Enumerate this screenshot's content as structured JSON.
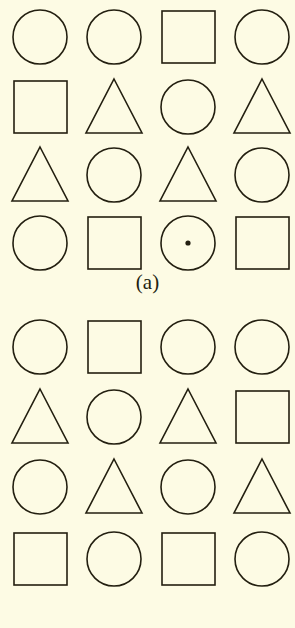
{
  "figure": {
    "background_color": "#fdfbe4",
    "stroke_color": "#231f10",
    "columns": 4,
    "rows": 4,
    "panels": [
      {
        "id": "a",
        "label": "(a)",
        "shapes": [
          [
            {
              "type": "circle",
              "marked": false
            },
            {
              "type": "circle",
              "marked": false
            },
            {
              "type": "square",
              "marked": false
            },
            {
              "type": "circle",
              "marked": false
            }
          ],
          [
            {
              "type": "square",
              "marked": false
            },
            {
              "type": "triangle",
              "marked": false
            },
            {
              "type": "circle",
              "marked": false
            },
            {
              "type": "triangle",
              "marked": false
            }
          ],
          [
            {
              "type": "triangle",
              "marked": false
            },
            {
              "type": "circle",
              "marked": false
            },
            {
              "type": "triangle",
              "marked": false
            },
            {
              "type": "circle",
              "marked": false
            }
          ],
          [
            {
              "type": "circle",
              "marked": false
            },
            {
              "type": "square",
              "marked": false
            },
            {
              "type": "circle",
              "marked": true
            },
            {
              "type": "square",
              "marked": false
            }
          ]
        ]
      },
      {
        "id": "b",
        "label": "(b)",
        "shapes": [
          [
            {
              "type": "circle",
              "marked": false
            },
            {
              "type": "square",
              "marked": false
            },
            {
              "type": "circle",
              "marked": false
            },
            {
              "type": "circle",
              "marked": false
            }
          ],
          [
            {
              "type": "triangle",
              "marked": false
            },
            {
              "type": "circle",
              "marked": false
            },
            {
              "type": "triangle",
              "marked": false
            },
            {
              "type": "square",
              "marked": false
            }
          ],
          [
            {
              "type": "circle",
              "marked": false
            },
            {
              "type": "triangle",
              "marked": false
            },
            {
              "type": "circle",
              "marked": false
            },
            {
              "type": "triangle",
              "marked": false
            }
          ],
          [
            {
              "type": "square",
              "marked": false
            },
            {
              "type": "circle",
              "marked": false
            },
            {
              "type": "square",
              "marked": false
            },
            {
              "type": "circle",
              "marked": false
            }
          ]
        ]
      }
    ]
  }
}
